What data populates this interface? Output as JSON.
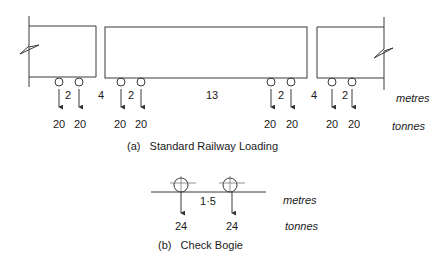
{
  "diagram": {
    "part_a": {
      "caption": "(a)   Standard Railway Loading",
      "spacings_m": [
        "2",
        "4",
        "2",
        "13",
        "2",
        "4",
        "2"
      ],
      "loads_t": [
        "20",
        "20",
        "20",
        "20",
        "20",
        "20",
        "20",
        "20"
      ],
      "unit_distance": "metres",
      "unit_load": "tonnes"
    },
    "part_b": {
      "caption": "(b)   Check Bogie",
      "spacing_m": "1·5",
      "loads_t": [
        "24",
        "24"
      ],
      "unit_distance": "metres",
      "unit_load": "tonnes"
    }
  }
}
